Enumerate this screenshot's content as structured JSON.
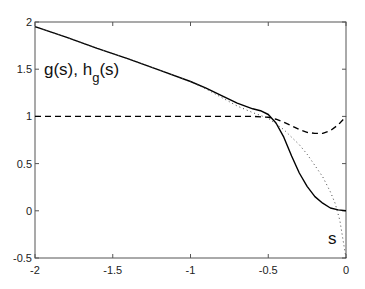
{
  "chart_data": {
    "type": "line",
    "title": "",
    "xlabel": "s",
    "ylabel": "g(s), h_g(s)",
    "xlim": [
      -2,
      0
    ],
    "ylim": [
      -0.5,
      2
    ],
    "grid": false,
    "legend": null,
    "xticks": [
      -2,
      -1.5,
      -1,
      -0.5,
      0
    ],
    "xtick_labels": [
      "-2",
      "-1.5",
      "-1",
      "-0.5",
      "0"
    ],
    "yticks": [
      -0.5,
      0,
      0.5,
      1,
      1.5,
      2
    ],
    "ytick_labels": [
      "-0.5",
      "0",
      "0.5",
      "1",
      "1.5",
      "2"
    ],
    "annotations": [
      {
        "text": "g(s), h",
        "sub": "g",
        "after": "(s)",
        "x": -1.88,
        "y": 1.5
      },
      {
        "text": "s",
        "x": -0.05,
        "y": -0.35
      }
    ],
    "series": [
      {
        "name": "solid",
        "style": "solid",
        "color": "#000000",
        "x": [
          -2,
          -1.8,
          -1.6,
          -1.4,
          -1.2,
          -1.0,
          -0.9,
          -0.8,
          -0.7,
          -0.6,
          -0.55,
          -0.5,
          -0.45,
          -0.4,
          -0.35,
          -0.3,
          -0.25,
          -0.2,
          -0.15,
          -0.1,
          -0.05,
          0
        ],
        "y": [
          1.95,
          1.84,
          1.72,
          1.61,
          1.49,
          1.37,
          1.3,
          1.22,
          1.14,
          1.08,
          1.06,
          1.02,
          0.93,
          0.78,
          0.58,
          0.4,
          0.26,
          0.15,
          0.08,
          0.03,
          0.01,
          0.0
        ]
      },
      {
        "name": "dashed",
        "style": "dashed",
        "color": "#000000",
        "x": [
          -2,
          -1.5,
          -1.0,
          -0.6,
          -0.5,
          -0.45,
          -0.4,
          -0.35,
          -0.3,
          -0.25,
          -0.2,
          -0.15,
          -0.1,
          -0.05,
          0
        ],
        "y": [
          1.0,
          1.0,
          1.0,
          1.0,
          0.99,
          0.97,
          0.94,
          0.9,
          0.86,
          0.83,
          0.82,
          0.82,
          0.85,
          0.91,
          1.0
        ]
      },
      {
        "name": "dotted",
        "style": "dotted",
        "color": "#000000",
        "x": [
          -2,
          -1.8,
          -1.6,
          -1.4,
          -1.2,
          -1.0,
          -0.9,
          -0.8,
          -0.7,
          -0.6,
          -0.5,
          -0.4,
          -0.3,
          -0.25,
          -0.2,
          -0.15,
          -0.1,
          -0.07,
          -0.04,
          -0.02,
          0
        ],
        "y": [
          1.95,
          1.84,
          1.72,
          1.61,
          1.49,
          1.37,
          1.29,
          1.2,
          1.11,
          1.04,
          0.98,
          0.86,
          0.7,
          0.6,
          0.48,
          0.36,
          0.2,
          0.08,
          -0.1,
          -0.3,
          -0.5
        ]
      }
    ]
  }
}
